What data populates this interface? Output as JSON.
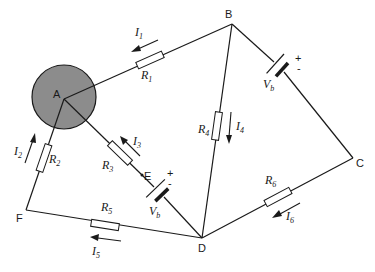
{
  "diagram": {
    "type": "electrical circuit",
    "colors": {
      "line": "#1a1a1a",
      "node_a_fill": "#8c8c8c",
      "background": "#ffffff"
    },
    "nodes": [
      {
        "id": "A",
        "label": "A"
      },
      {
        "id": "B",
        "label": "B"
      },
      {
        "id": "C",
        "label": "C"
      },
      {
        "id": "D",
        "label": "D"
      },
      {
        "id": "E",
        "label": "E"
      },
      {
        "id": "F",
        "label": "F"
      }
    ],
    "resistors": [
      {
        "id": "R1",
        "label": "R",
        "sub": "1",
        "between": [
          "A",
          "B"
        ]
      },
      {
        "id": "R2",
        "label": "R",
        "sub": "2",
        "between": [
          "A",
          "F"
        ]
      },
      {
        "id": "R3",
        "label": "R",
        "sub": "3",
        "between": [
          "A",
          "E"
        ]
      },
      {
        "id": "R4",
        "label": "R",
        "sub": "4",
        "between": [
          "B",
          "D"
        ]
      },
      {
        "id": "R5",
        "label": "R",
        "sub": "5",
        "between": [
          "F",
          "D"
        ]
      },
      {
        "id": "R6",
        "label": "R",
        "sub": "6",
        "between": [
          "D",
          "C"
        ]
      }
    ],
    "sources": [
      {
        "id": "Vb1",
        "label": "V",
        "sub": "b",
        "between": [
          "B",
          "C"
        ],
        "plus": "+",
        "minus": "-"
      },
      {
        "id": "Vb2",
        "label": "V",
        "sub": "b",
        "between": [
          "E",
          "D"
        ],
        "plus": "+",
        "minus": "-"
      }
    ],
    "currents": [
      {
        "id": "I1",
        "label": "I",
        "sub": "1",
        "direction": "B to A"
      },
      {
        "id": "I2",
        "label": "I",
        "sub": "2",
        "direction": "F to A"
      },
      {
        "id": "I3",
        "label": "I",
        "sub": "3",
        "direction": "E to A"
      },
      {
        "id": "I4",
        "label": "I",
        "sub": "4",
        "direction": "B to D"
      },
      {
        "id": "I5",
        "label": "I",
        "sub": "5",
        "direction": "D to F"
      },
      {
        "id": "I6",
        "label": "I",
        "sub": "6",
        "direction": "C to D"
      }
    ]
  }
}
